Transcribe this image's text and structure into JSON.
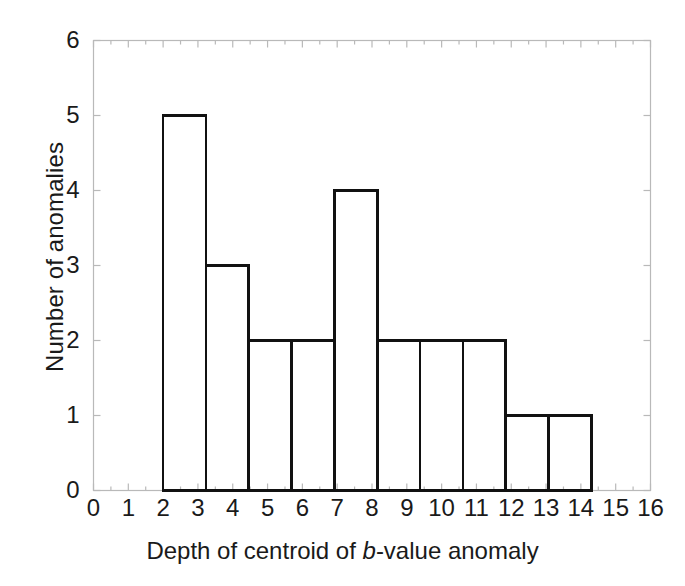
{
  "chart_data": {
    "type": "bar",
    "title": "",
    "subtitle": "",
    "xlabel_parts": {
      "pre": "Depth of centroid of ",
      "italic": "b",
      "post": "-value anomaly"
    },
    "xlabel": "Depth of centroid of b-value anomaly",
    "ylabel": "Number of anomalies",
    "xlim": [
      0,
      16
    ],
    "ylim": [
      0,
      6
    ],
    "xticks": [
      0,
      1,
      2,
      3,
      4,
      5,
      6,
      7,
      8,
      9,
      10,
      11,
      12,
      13,
      14,
      15,
      16
    ],
    "xtick_labels": [
      "0",
      "1",
      "2",
      "3",
      "4",
      "5",
      "6",
      "7",
      "8",
      "9",
      "10",
      "11",
      "12",
      "13",
      "14",
      "15",
      "16"
    ],
    "yticks": [
      0,
      1,
      2,
      3,
      4,
      5,
      6
    ],
    "ytick_labels": [
      "0",
      "1",
      "2",
      "3",
      "4",
      "5",
      "6"
    ],
    "grid": false,
    "legend": null,
    "bar_style": {
      "fill": "none",
      "stroke": "#111111",
      "stroke_width": 2.6
    },
    "axis_style": {
      "stroke": "#b9b9b9",
      "stroke_width": 1.2,
      "tick_direction": "in",
      "frame": "box"
    },
    "bin_edges": [
      2.0,
      3.23,
      4.46,
      5.69,
      6.92,
      8.15,
      9.38,
      10.61,
      11.84,
      13.07,
      14.3
    ],
    "categories": [
      "2.0-3.23",
      "3.23-4.46",
      "4.46-5.69",
      "5.69-6.92",
      "6.92-8.15",
      "8.15-9.38",
      "9.38-10.61",
      "10.61-11.84",
      "11.84-13.07",
      "13.07-14.3"
    ],
    "values": [
      5,
      3,
      2,
      2,
      4,
      2,
      2,
      2,
      1,
      1
    ]
  }
}
